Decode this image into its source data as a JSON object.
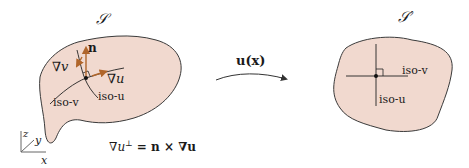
{
  "colors": {
    "surface_fill": "#f1d9cf",
    "outline": "#3a3a3a",
    "vector_accent": "#b0652a",
    "background": "#ffffff"
  },
  "left_surface": {
    "title": "𝒮",
    "labels": {
      "normal": "n",
      "grad_v": "∇v",
      "grad_u": "∇u",
      "iso_v": "iso-v",
      "iso_u": "iso-u"
    }
  },
  "mapping": {
    "label": "u(x)"
  },
  "right_surface": {
    "title": "𝒮′",
    "labels": {
      "iso_v": "iso-v",
      "iso_u": "iso-u"
    }
  },
  "axes": {
    "x": "x",
    "y": "y",
    "z": "z"
  },
  "equation": {
    "lhs": "∇u",
    "sup": "⊥",
    "rhs": " = n × ∇u"
  }
}
